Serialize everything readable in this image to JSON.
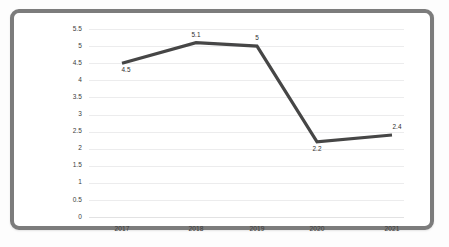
{
  "chart_data": {
    "type": "line",
    "title": "",
    "subtitle": "",
    "xlabel": "",
    "ylabel": "",
    "categories": [
      "2017",
      "2018",
      "2019",
      "2020",
      "2021"
    ],
    "values": [
      4.5,
      5.1,
      5,
      2.2,
      2.4
    ],
    "point_labels": [
      "4.5",
      "5.1",
      "5",
      "2.2",
      "2.4"
    ],
    "point_label_positions": [
      "below",
      "above",
      "above",
      "below",
      "above"
    ],
    "ylim": [
      0,
      5.5
    ],
    "ytick_labels": [
      "5.5",
      "5",
      "4.5",
      "4",
      "3.5",
      "3",
      "2.5",
      "2",
      "1.5",
      "1",
      "0.5",
      "0"
    ],
    "ytick_values": [
      5.5,
      5,
      4.5,
      4,
      3.5,
      3,
      2.5,
      2,
      1.5,
      1,
      0.5,
      0
    ],
    "grid": true,
    "legend": "none",
    "series_color": "#464646",
    "grid_color": "#ececed",
    "frame_color": "#7c7c7c",
    "background_color": "#ffffff"
  }
}
